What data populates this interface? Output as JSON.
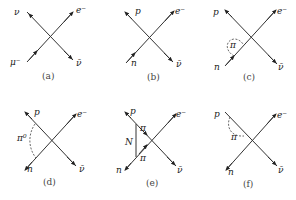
{
  "figure": {
    "panels": [
      {
        "id": "a",
        "caption": "(a)",
        "labels": {
          "top_left": "ν",
          "top_right": "e⁻",
          "bottom_left": "μ⁻",
          "bottom_right": "ν̄"
        },
        "extras": []
      },
      {
        "id": "b",
        "caption": "(b)",
        "labels": {
          "top_left": "p",
          "top_right": "e⁻",
          "bottom_left": "n",
          "bottom_right": "ν̄"
        },
        "extras": []
      },
      {
        "id": "c",
        "caption": "(c)",
        "labels": {
          "top_left": "p",
          "top_right": "e⁻",
          "bottom_left": "n",
          "bottom_right": "ν̄"
        },
        "extras": [
          {
            "type": "dashed-loop",
            "label": "π"
          }
        ]
      },
      {
        "id": "d",
        "caption": "(d)",
        "labels": {
          "top_left": "p",
          "top_right": "e⁻",
          "bottom_left": "n",
          "bottom_right": "ν̄"
        },
        "extras": [
          {
            "type": "dashed-arc",
            "label": "π⁰"
          }
        ]
      },
      {
        "id": "e",
        "caption": "(e)",
        "labels": {
          "top_left": "p",
          "top_right": "e⁻",
          "bottom_left": "n",
          "bottom_right": "ν̄"
        },
        "extras": [
          {
            "type": "triangle",
            "side_label": "N",
            "upper_label": "π",
            "lower_label": "π"
          }
        ]
      },
      {
        "id": "f",
        "caption": "(f)",
        "labels": {
          "top_left": "p",
          "top_right": "e⁻",
          "bottom_left": "n",
          "bottom_right": "ν̄"
        },
        "extras": [
          {
            "type": "dashed-loop",
            "label": "π"
          }
        ]
      }
    ]
  }
}
